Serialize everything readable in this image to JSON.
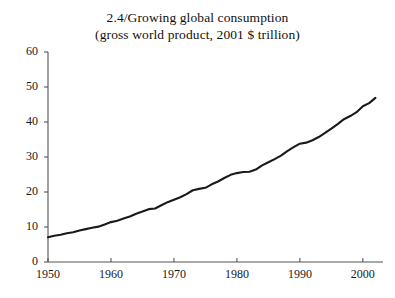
{
  "chart_data": {
    "type": "line",
    "title": "2.4/Growing global consumption",
    "subtitle": "(gross world product, 2001 $ trillion)",
    "title_lines": [
      "2.4/Growing global consumption",
      "(gross world product, 2001 $ trillion)"
    ],
    "xlabel": "",
    "ylabel": "",
    "xlim": [
      1950,
      2003
    ],
    "ylim": [
      0,
      60
    ],
    "grid": false,
    "legend": false,
    "legend_position": "none",
    "line_color": "#1a1a1a",
    "axis_color": "#555555",
    "background_color": "#ffffff",
    "yticks": [
      0,
      10,
      20,
      30,
      40,
      50,
      60
    ],
    "ytick_labels": [
      "0",
      "10",
      "20",
      "30",
      "40",
      "50",
      "60"
    ],
    "xticks": [
      1950,
      1960,
      1970,
      1980,
      1990,
      2000
    ],
    "xtick_labels": [
      "1950",
      "1960",
      "1970",
      "1980",
      "1990",
      "2000"
    ],
    "series": [
      {
        "name": "Gross world product",
        "units": "2001 $ trillion",
        "x": [
          1950,
          1951,
          1952,
          1953,
          1954,
          1955,
          1956,
          1957,
          1958,
          1959,
          1960,
          1961,
          1962,
          1963,
          1964,
          1965,
          1966,
          1967,
          1968,
          1969,
          1970,
          1971,
          1972,
          1973,
          1974,
          1975,
          1976,
          1977,
          1978,
          1979,
          1980,
          1981,
          1982,
          1983,
          1984,
          1985,
          1986,
          1987,
          1988,
          1989,
          1990,
          1991,
          1992,
          1993,
          1994,
          1995,
          1996,
          1997,
          1998,
          1999,
          2000,
          2001,
          2002
        ],
        "values": [
          7.1,
          7.5,
          7.8,
          8.2,
          8.5,
          9.0,
          9.4,
          9.8,
          10.1,
          10.7,
          11.4,
          11.8,
          12.4,
          13.0,
          13.8,
          14.4,
          15.1,
          15.3,
          16.2,
          17.1,
          17.8,
          18.5,
          19.4,
          20.5,
          20.9,
          21.2,
          22.2,
          23.0,
          24.0,
          24.9,
          25.4,
          25.7,
          25.8,
          26.4,
          27.6,
          28.5,
          29.4,
          30.4,
          31.7,
          32.8,
          33.8,
          34.1,
          34.8,
          35.7,
          36.9,
          38.1,
          39.4,
          40.8,
          41.7,
          42.8,
          44.5,
          45.4,
          46.9
        ]
      }
    ]
  },
  "axes": {
    "y_axis_name": "gross world product axis",
    "x_axis_name": "year axis"
  }
}
